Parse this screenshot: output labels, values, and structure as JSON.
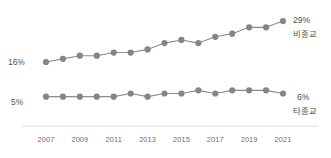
{
  "chart_data": {
    "type": "line",
    "title": "",
    "xlabel": "",
    "ylabel": "",
    "grid": false,
    "legend_position": "end-of-line",
    "x": [
      2007,
      2008,
      2009,
      2010,
      2011,
      2012,
      2013,
      2014,
      2015,
      2016,
      2017,
      2018,
      2019,
      2020,
      2021
    ],
    "tick_labels": [
      "2007",
      "2009",
      "2011",
      "2013",
      "2015",
      "2017",
      "2019",
      "2021"
    ],
    "tick_values": [
      2007,
      2009,
      2011,
      2013,
      2015,
      2017,
      2019,
      2021
    ],
    "xlim": [
      2007,
      2021
    ],
    "ylim": [
      0,
      32
    ],
    "series": [
      {
        "name": "비종교",
        "color": "#858585",
        "values": [
          16,
          17,
          18,
          18,
          19,
          19,
          20,
          22,
          23,
          22,
          24,
          25,
          27,
          27,
          29
        ],
        "start_label": "16%",
        "end_label": "29%"
      },
      {
        "name": "타종교",
        "color": "#858585",
        "values": [
          5,
          5,
          5,
          5,
          5,
          6,
          5,
          6,
          6,
          7,
          6,
          7,
          7,
          7,
          6
        ],
        "start_label": "5%",
        "end_label": "6%"
      }
    ]
  },
  "labels": {
    "upper_start_value": "16%",
    "upper_end_value": "29%",
    "upper_series_name": "비종교",
    "lower_start_value": "5%",
    "lower_end_value": "6%",
    "lower_series_name": "타종교"
  },
  "axis": {
    "ticks": [
      "2007",
      "2009",
      "2011",
      "2013",
      "2015",
      "2017",
      "2019",
      "2021"
    ]
  },
  "colors": {
    "marker": "#858585",
    "line": "#8d8d8d",
    "axis": "#e9e9e9",
    "tick_text": "#6f6f6f",
    "label_text": "#4f4f4f"
  }
}
